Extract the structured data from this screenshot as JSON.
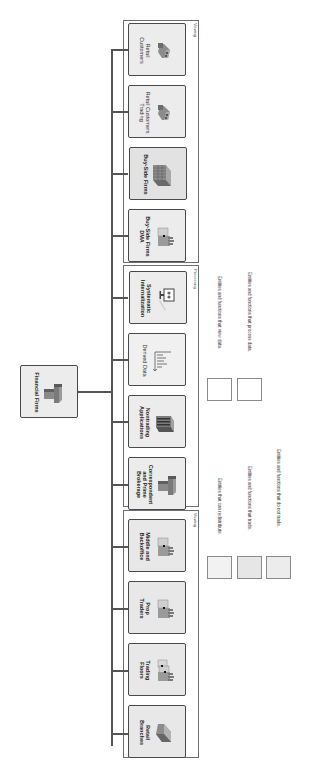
{
  "diagram": {
    "root": {
      "label": "Financial Firms",
      "icon": "office-tower-icon"
    },
    "groups": [
      {
        "id": "viewing",
        "label": "Viewing",
        "nodes": [
          {
            "label_lines": [
              "Retail",
              "Customers"
            ],
            "icon": "people-group-icon",
            "bold": false
          },
          {
            "label_lines": [
              "Retail Customers",
              "Trading"
            ],
            "icon": "people-group-icon",
            "bold": false
          },
          {
            "label_lines": [
              "Buy-Side Firms"
            ],
            "icon": "office-building-icon",
            "bold": true
          },
          {
            "label_lines": [
              "Buy-Side Firms",
              "DMA"
            ],
            "icon": "trading-desk-icon",
            "bold": true
          }
        ]
      },
      {
        "id": "processing",
        "label": "Processing",
        "nodes": [
          {
            "label_lines": [
              "Systematic",
              "Internalization"
            ],
            "icon": "computer-monitor-icon",
            "bold": true
          },
          {
            "label_lines": [
              "Derived Data"
            ],
            "icon": "bar-chart-axes-icon",
            "bold": false
          },
          {
            "label_lines": [
              "Nontrading",
              "Applications"
            ],
            "icon": "server-rack-icon",
            "bold": true
          },
          {
            "label_lines": [
              "Correspondent",
              "and Prime",
              "Brokerage"
            ],
            "icon": "office-tower-icon",
            "bold": true
          }
        ]
      },
      {
        "id": "trading",
        "label": "Viewing",
        "nodes": [
          {
            "label_lines": [
              "Middle and",
              "Backoffice"
            ],
            "icon": "trading-desk-icon",
            "bold": true
          },
          {
            "label_lines": [
              "Prop",
              "Traders"
            ],
            "icon": "trading-desk-icon",
            "bold": true
          },
          {
            "label_lines": [
              "Trading",
              "Floors"
            ],
            "icon": "trading-floor-icon",
            "bold": true
          },
          {
            "label_lines": [
              "Retail",
              "Branches"
            ],
            "icon": "bank-branch-icon",
            "bold": true
          }
        ]
      }
    ]
  },
  "legend": [
    {
      "label": "Entities and functions that view data.",
      "fill": "#ffffff"
    },
    {
      "label": "Entities and functions that process data.",
      "fill": "#ffffff"
    },
    {
      "label": "Entities that can redistribute.",
      "fill": "#f2f2f2"
    },
    {
      "label": "Entities and functions that trade.",
      "fill": "#e6e6e6"
    },
    {
      "label": "Entities and functions that do not trade.",
      "fill": "#ececec"
    }
  ],
  "colors": {
    "connector": "#555555",
    "node_border": "#4a4a4a",
    "group_border": "#6e6e6e"
  }
}
